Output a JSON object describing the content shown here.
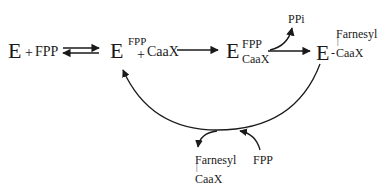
{
  "diagram": {
    "nodes": {
      "enzyme_free": {
        "E": "E",
        "plus": "+",
        "fpp": "FPP"
      },
      "enzyme_fpp": {
        "E": "E",
        "sup": "FPP",
        "plus": "+",
        "caax": "CaaX"
      },
      "ternary": {
        "E": "E",
        "sup": "FPP",
        "sub": "CaaX"
      },
      "product_complex": {
        "E": "E",
        "dash": "-",
        "farnesyl": "Farnesyl",
        "bond": "|",
        "caax": "CaaX"
      },
      "ppi": "PPi",
      "released_product": {
        "farnesyl": "Farnesyl",
        "bond": "|",
        "caax": "CaaX"
      },
      "incoming_fpp": "FPP"
    },
    "edges": [
      {
        "from": "enzyme_free",
        "to": "enzyme_fpp",
        "type": "reversible"
      },
      {
        "from": "enzyme_fpp",
        "to": "ternary",
        "type": "forward"
      },
      {
        "from": "ternary",
        "to": "product_complex",
        "type": "forward",
        "side_product": "PPi"
      },
      {
        "from": "product_complex",
        "to": "enzyme_fpp",
        "type": "cycle",
        "input": "FPP",
        "output": "Farnesyl-CaaX"
      }
    ],
    "colors": {
      "ink": "#1a1a1a",
      "background": "#ffffff"
    }
  }
}
